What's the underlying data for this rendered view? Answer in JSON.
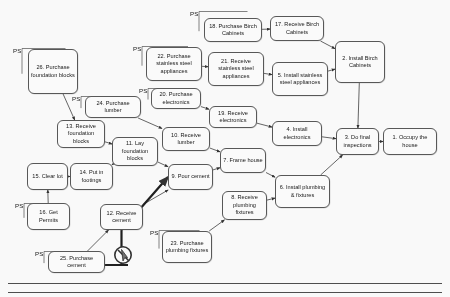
{
  "diagram": {
    "type": "precedence-network",
    "ps_marker": "PS",
    "nodes": [
      {
        "id": "n26",
        "label": "26. Purchase foundation blocks",
        "x": 28,
        "y": 49,
        "w": 50,
        "h": 45,
        "ps": true,
        "ps_x": 13,
        "ps_y": 47
      },
      {
        "id": "n18",
        "label": "18. Purchase Birch Cabinets",
        "x": 204,
        "y": 18,
        "w": 58,
        "h": 24,
        "ps": true,
        "ps_x": 190,
        "ps_y": 10
      },
      {
        "id": "n17",
        "label": "17. Receive Birch Cabinets",
        "x": 270,
        "y": 16,
        "w": 54,
        "h": 25,
        "ps": false
      },
      {
        "id": "n2",
        "label": "2. Install Birch Cabinets",
        "x": 335,
        "y": 41,
        "w": 50,
        "h": 42,
        "ps": false
      },
      {
        "id": "n22",
        "label": "22. Purchase stainless steel appliances",
        "x": 146,
        "y": 47,
        "w": 56,
        "h": 34,
        "ps": true,
        "ps_x": 133,
        "ps_y": 45
      },
      {
        "id": "n21",
        "label": "21. Receive stainless steel appliances",
        "x": 208,
        "y": 52,
        "w": 56,
        "h": 34,
        "ps": false
      },
      {
        "id": "n5",
        "label": "5. Install stainless steel appliances",
        "x": 272,
        "y": 62,
        "w": 56,
        "h": 34,
        "ps": false
      },
      {
        "id": "n20",
        "label": "20. Purchase electronics",
        "x": 151,
        "y": 88,
        "w": 50,
        "h": 21,
        "ps": true,
        "ps_x": 139,
        "ps_y": 87
      },
      {
        "id": "n19",
        "label": "19. Receive electronics",
        "x": 209,
        "y": 106,
        "w": 48,
        "h": 22,
        "ps": false
      },
      {
        "id": "n4",
        "label": "4. Install electronics",
        "x": 272,
        "y": 121,
        "w": 50,
        "h": 25,
        "ps": false
      },
      {
        "id": "n24",
        "label": "24. Purchase lumber",
        "x": 85,
        "y": 96,
        "w": 56,
        "h": 22,
        "ps": true,
        "ps_x": 72,
        "ps_y": 95
      },
      {
        "id": "n13",
        "label": "13. Receive foundation blocks",
        "x": 57,
        "y": 120,
        "w": 48,
        "h": 28,
        "ps": false
      },
      {
        "id": "n10",
        "label": "10. Receive lumber",
        "x": 162,
        "y": 127,
        "w": 48,
        "h": 24,
        "ps": false
      },
      {
        "id": "n11",
        "label": "11. Lay foundation blocks",
        "x": 112,
        "y": 137,
        "w": 46,
        "h": 29,
        "ps": false
      },
      {
        "id": "n7",
        "label": "7. Frame house",
        "x": 220,
        "y": 148,
        "w": 46,
        "h": 25,
        "ps": false
      },
      {
        "id": "n3",
        "label": "3. Do final inspections",
        "x": 336,
        "y": 128,
        "w": 43,
        "h": 27,
        "ps": false
      },
      {
        "id": "n1",
        "label": "1. Occupy the house",
        "x": 383,
        "y": 128,
        "w": 54,
        "h": 27,
        "ps": false
      },
      {
        "id": "n15",
        "label": "15. Clear lot",
        "x": 27,
        "y": 163,
        "w": 41,
        "h": 27,
        "ps": false
      },
      {
        "id": "n14",
        "label": "14. Put in footings",
        "x": 70,
        "y": 163,
        "w": 43,
        "h": 27,
        "ps": false
      },
      {
        "id": "n9",
        "label": "9. Pour cement",
        "x": 168,
        "y": 164,
        "w": 45,
        "h": 26,
        "ps": false
      },
      {
        "id": "n6",
        "label": "6. Install plumbing  & fixtures",
        "x": 275,
        "y": 175,
        "w": 55,
        "h": 33,
        "ps": false
      },
      {
        "id": "n8",
        "label": "8. Receive plumbing fixtures",
        "x": 222,
        "y": 191,
        "w": 45,
        "h": 29,
        "ps": false
      },
      {
        "id": "n16",
        "label": "16. Get Permits",
        "x": 27,
        "y": 203,
        "w": 43,
        "h": 27,
        "ps": true,
        "ps_x": 15,
        "ps_y": 202
      },
      {
        "id": "n12",
        "label": "12. Receive cement",
        "x": 100,
        "y": 204,
        "w": 43,
        "h": 26,
        "ps": false
      },
      {
        "id": "n23",
        "label": "23. Purchase plumbing fixtures",
        "x": 162,
        "y": 231,
        "w": 50,
        "h": 32,
        "ps": true,
        "ps_x": 150,
        "ps_y": 229
      },
      {
        "id": "n25",
        "label": "25. Purchase cement",
        "x": 48,
        "y": 251,
        "w": 57,
        "h": 22,
        "ps": true,
        "ps_x": 35,
        "ps_y": 250
      }
    ],
    "edges": [
      {
        "from": "n26",
        "to": "n13"
      },
      {
        "from": "n18",
        "to": "n17"
      },
      {
        "from": "n17",
        "to": "n2"
      },
      {
        "from": "n2",
        "to": "n3"
      },
      {
        "from": "n22",
        "to": "n21"
      },
      {
        "from": "n21",
        "to": "n5"
      },
      {
        "from": "n5",
        "to": "n2"
      },
      {
        "from": "n20",
        "to": "n19"
      },
      {
        "from": "n19",
        "to": "n4"
      },
      {
        "from": "n4",
        "to": "n3"
      },
      {
        "from": "n24",
        "to": "n10"
      },
      {
        "from": "n13",
        "to": "n11"
      },
      {
        "from": "n10",
        "to": "n7"
      },
      {
        "from": "n11",
        "to": "n9"
      },
      {
        "from": "n15",
        "to": "n14"
      },
      {
        "from": "n14",
        "to": "n11"
      },
      {
        "from": "n16",
        "to": "n15"
      },
      {
        "from": "n12",
        "to": "n9"
      },
      {
        "from": "n9",
        "to": "n7"
      },
      {
        "from": "n7",
        "to": "n6"
      },
      {
        "from": "n8",
        "to": "n6"
      },
      {
        "from": "n6",
        "to": "n3"
      },
      {
        "from": "n3",
        "to": "n1"
      },
      {
        "from": "n23",
        "to": "n8"
      },
      {
        "from": "n25",
        "to": "n12"
      }
    ],
    "cursor_icon": {
      "name": "no-drop-cursor-icon",
      "x": 112,
      "y": 244,
      "size": 26
    }
  }
}
